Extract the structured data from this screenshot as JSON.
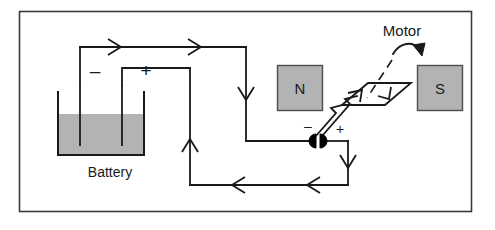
{
  "figure": {
    "kind": "circuit-diagram",
    "title_visible": false,
    "frame": {
      "stroke": "#3a3a3a",
      "fill": "#ffffff",
      "x": 19,
      "y": 11,
      "width": 453,
      "height": 201
    }
  },
  "labels": {
    "motor": "Motor",
    "battery": "Battery",
    "north_pole": "N",
    "south_pole": "S",
    "battery_negative": "–",
    "battery_positive": "+",
    "commutator_negative": "–",
    "commutator_positive": "+"
  },
  "colors": {
    "line": "#1a1a1a",
    "frame": "#3a3a3a",
    "magnet_fill": "#b3b3b3",
    "magnet_stroke": "#4d4d4d",
    "electrolyte_fill": "#b3b3b3",
    "beaker_stroke": "#1a1a1a",
    "commutator_fill": "#000000",
    "background": "#ffffff"
  },
  "components": {
    "battery": {
      "name": "wet-cell-battery",
      "beaker": {
        "x": 58,
        "y": 92,
        "width": 86,
        "height": 63
      },
      "electrolyte_top_y": 114,
      "electrode_negative_x": 80,
      "electrode_positive_x": 122,
      "electrode_top_y": 85,
      "electrode_bottom_y": 146
    },
    "magnet_north": {
      "x": 277,
      "y": 65,
      "width": 46,
      "height": 46,
      "label": "N"
    },
    "magnet_south": {
      "x": 417,
      "y": 65,
      "width": 46,
      "height": 46,
      "label": "S"
    },
    "commutator": {
      "name": "split-ring-commutator",
      "center_x": 318,
      "center_y": 141,
      "radius": 7,
      "halves": 2
    },
    "coil": {
      "name": "armature-coil-loop",
      "shape": "parallelogram",
      "points": "342,105 368,83 411,83 385,105",
      "current_arrows": 2
    }
  },
  "wires": {
    "description": "conventional current path from battery positive terminal through motor coil and back to negative terminal",
    "segments": [
      {
        "id": "neg-electrode-up",
        "path": "M80,85 L80,47"
      },
      {
        "id": "top-wire",
        "path": "M80,47 L246,47"
      },
      {
        "id": "right-down",
        "path": "M246,47 L246,141"
      },
      {
        "id": "to-commutator",
        "path": "M246,141 L311,141"
      },
      {
        "id": "commutator-out",
        "path": "M325,141 L348,141"
      },
      {
        "id": "right-drop",
        "path": "M348,141 L348,185"
      },
      {
        "id": "bottom-wire",
        "path": "M348,185 L190,185"
      },
      {
        "id": "left-up",
        "path": "M190,185 L190,68"
      },
      {
        "id": "pos-electrode-down",
        "path": "M190,68 L122,68 L122,85"
      }
    ],
    "arrows": [
      {
        "id": "top-arrow-1",
        "x": 118,
        "y": 47,
        "dir": "right"
      },
      {
        "id": "top-arrow-2",
        "x": 198,
        "y": 47,
        "dir": "right"
      },
      {
        "id": "right-down-arrow",
        "x": 246,
        "y": 97,
        "dir": "down"
      },
      {
        "id": "commutator-down-arrow",
        "x": 348,
        "y": 163,
        "dir": "down"
      },
      {
        "id": "bottom-arrow-1",
        "x": 310,
        "y": 185,
        "dir": "left"
      },
      {
        "id": "bottom-arrow-2",
        "x": 235,
        "y": 185,
        "dir": "left"
      },
      {
        "id": "left-up-arrow",
        "x": 190,
        "y": 142,
        "dir": "up"
      }
    ]
  },
  "annotations": {
    "motor_leader_line": {
      "style": "dashed",
      "path": "M391,62 L365,98"
    },
    "rotation_arrow": {
      "description": "curved arrow indicating coil rotation direction",
      "path": "M394,53 C404,40 416,42 421,50"
    }
  }
}
